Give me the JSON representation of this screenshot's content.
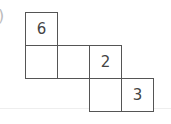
{
  "label": {
    "text": ")"
  },
  "net": {
    "cells": [
      {
        "row": 0,
        "col": 0,
        "value": "6"
      },
      {
        "row": 1,
        "col": 0,
        "value": ""
      },
      {
        "row": 1,
        "col": 1,
        "value": ""
      },
      {
        "row": 1,
        "col": 2,
        "value": "2"
      },
      {
        "row": 2,
        "col": 2,
        "value": ""
      },
      {
        "row": 2,
        "col": 3,
        "value": "3"
      }
    ]
  }
}
